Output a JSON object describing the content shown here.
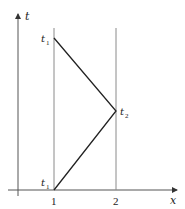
{
  "diagram": {
    "axes": {
      "x_label": "x",
      "t_label": "t",
      "x_ticks": [
        "1",
        "2"
      ]
    },
    "vertical_lines_at_x": [
      1,
      2
    ],
    "points": [
      {
        "name": "t_1_top",
        "base": "t",
        "sub": "1",
        "x": 1,
        "position": "upper"
      },
      {
        "name": "t_2",
        "base": "t",
        "sub": "2",
        "x": 2,
        "position": "middle"
      },
      {
        "name": "t_1_bottom",
        "base": "t",
        "sub": "1",
        "x": 1,
        "position": "lower"
      }
    ],
    "path": "triangle from (1, t1 upper) to (2, t2) to (1, t1 lower)",
    "colors": {
      "axis": "#444444",
      "line": "#222222",
      "guide": "#8a8a8a"
    }
  }
}
